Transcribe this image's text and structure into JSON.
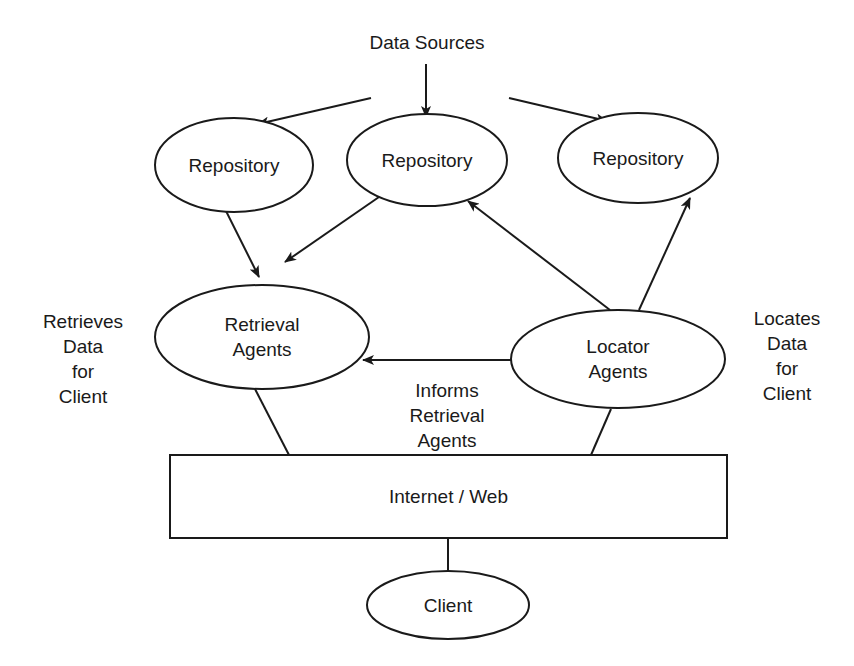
{
  "diagram": {
    "title": "Data Sources",
    "colors": {
      "ink": "#1a1a1a",
      "background": "#ffffff"
    },
    "nodes": [
      {
        "id": "repo_left",
        "shape": "ellipse",
        "lines": [
          "Repository"
        ],
        "cx": 234,
        "cy": 165,
        "rx": 79,
        "ry": 47
      },
      {
        "id": "repo_center",
        "shape": "ellipse",
        "lines": [
          "Repository"
        ],
        "cx": 427,
        "cy": 160,
        "rx": 80,
        "ry": 46
      },
      {
        "id": "repo_right",
        "shape": "ellipse",
        "lines": [
          "Repository"
        ],
        "cx": 638,
        "cy": 158,
        "rx": 80,
        "ry": 45
      },
      {
        "id": "retrieval_agents",
        "shape": "ellipse",
        "lines": [
          "Retrieval",
          "Agents"
        ],
        "cx": 262,
        "cy": 337,
        "rx": 107,
        "ry": 52
      },
      {
        "id": "locator_agents",
        "shape": "ellipse",
        "lines": [
          "Locator",
          "Agents"
        ],
        "cx": 618,
        "cy": 359,
        "rx": 107,
        "ry": 49
      },
      {
        "id": "internet_web",
        "shape": "rect",
        "lines": [
          "Internet / Web"
        ],
        "x": 170,
        "y": 455,
        "w": 557,
        "h": 83
      },
      {
        "id": "client",
        "shape": "ellipse",
        "lines": [
          "Client"
        ],
        "cx": 448,
        "cy": 605,
        "rx": 81,
        "ry": 34
      }
    ],
    "edges": [
      {
        "from": "data_sources",
        "to": "repo_center",
        "arrow": true,
        "x1": 426,
        "y1": 64,
        "x2": 426,
        "y2": 117
      },
      {
        "from": "data_sources",
        "to": "repo_left",
        "arrow": true,
        "x1": 371,
        "y1": 98,
        "x2": 258,
        "y2": 124
      },
      {
        "from": "data_sources",
        "to": "repo_right",
        "arrow": true,
        "x1": 509,
        "y1": 98,
        "x2": 607,
        "y2": 121
      },
      {
        "from": "repo_left",
        "to": "retrieval_agents",
        "arrow": true,
        "x1": 224,
        "y1": 207,
        "x2": 259,
        "y2": 277
      },
      {
        "from": "repo_center",
        "to": "retrieval_agents",
        "arrow": true,
        "x1": 379,
        "y1": 197,
        "x2": 285,
        "y2": 262
      },
      {
        "from": "locator_agents",
        "to": "repo_center",
        "arrow": true,
        "x1": 610,
        "y1": 310,
        "x2": 468,
        "y2": 201
      },
      {
        "from": "locator_agents",
        "to": "repo_right",
        "arrow": true,
        "x1": 639,
        "y1": 310,
        "x2": 690,
        "y2": 198
      },
      {
        "from": "locator_agents",
        "to": "retrieval_agents",
        "arrow": true,
        "x1": 511,
        "y1": 360,
        "x2": 363,
        "y2": 360
      },
      {
        "from": "retrieval_agents",
        "to": "internet_web",
        "arrow": false,
        "x1": 255,
        "y1": 389,
        "x2": 289,
        "y2": 455
      },
      {
        "from": "locator_agents",
        "to": "internet_web",
        "arrow": false,
        "x1": 611,
        "y1": 409,
        "x2": 591,
        "y2": 455
      },
      {
        "from": "internet_web",
        "to": "client",
        "arrow": false,
        "x1": 448,
        "y1": 538,
        "x2": 448,
        "y2": 571
      }
    ],
    "annotations": [
      {
        "id": "title",
        "lines": [
          "Data Sources"
        ],
        "x": 427,
        "y": 42
      },
      {
        "id": "retrieves_note",
        "lines": [
          "Retrieves",
          "Data",
          "for",
          "Client"
        ],
        "x": 83,
        "y": 321
      },
      {
        "id": "informs_note",
        "lines": [
          "Informs",
          "Retrieval",
          "Agents"
        ],
        "x": 447,
        "y": 390
      },
      {
        "id": "locates_note",
        "lines": [
          "Locates",
          "Data",
          "for",
          "Client"
        ],
        "x": 787,
        "y": 318
      }
    ],
    "line_height": 25
  }
}
